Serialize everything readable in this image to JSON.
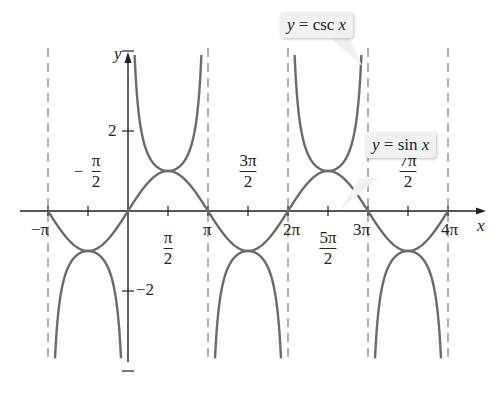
{
  "chart_data": {
    "type": "line",
    "title": "",
    "xlabel": "x",
    "ylabel": "y",
    "xlim": [
      -3.14159,
      12.566
    ],
    "ylim": [
      -3.75,
      4.0
    ],
    "grid": false,
    "x_tick_labels": [
      "−π",
      "−π/2",
      "π/2",
      "π",
      "3π/2",
      "2π",
      "5π/2",
      "3π",
      "7π/2",
      "4π"
    ],
    "x_ticks": [
      -3.14159,
      -1.5708,
      1.5708,
      3.14159,
      4.7124,
      6.28319,
      7.854,
      9.42478,
      10.9956,
      12.5664
    ],
    "y_tick_labels": [
      "2",
      "−2"
    ],
    "y_ticks": [
      -4,
      -2,
      2,
      4
    ],
    "asymptotes_x": [
      -3.14159,
      0,
      3.14159,
      6.28319,
      9.42478,
      12.5664
    ],
    "series": [
      {
        "name": "y = sin x",
        "function": "sin",
        "domain": [
          -3.14159,
          12.5664
        ],
        "color": "#6b6b6b"
      },
      {
        "name": "y = csc x",
        "function": "csc",
        "domain": [
          -3.14159,
          12.5664
        ],
        "color": "#6b6b6b"
      }
    ],
    "annotations": [
      {
        "text": "y = csc x",
        "points_to": "csc branch near x = 2π (right)"
      },
      {
        "text": "y = sin x",
        "points_to": "sin curve near x = 3π"
      }
    ]
  },
  "labels": {
    "x_axis": "x",
    "y_axis": "y",
    "y_pos2": "2",
    "y_neg2": "−2",
    "neg_pi": "−π",
    "pi": "π",
    "two_pi": "2π",
    "three_pi": "3π",
    "four_pi": "4π",
    "neg_sign": "−",
    "pi_num": "π",
    "three_pi_num": "3π",
    "five_pi_num": "5π",
    "seven_pi_num": "7π",
    "den": "2",
    "csc_prefix": "y",
    "csc_eq": " = csc ",
    "csc_var": "x",
    "sin_prefix": "y",
    "sin_eq": " = sin ",
    "sin_var": "x"
  },
  "colors": {
    "curve": "#6b6b6b",
    "axis": "#222222",
    "asymptote": "#888888",
    "callout_bg": "#f1f1f1"
  }
}
